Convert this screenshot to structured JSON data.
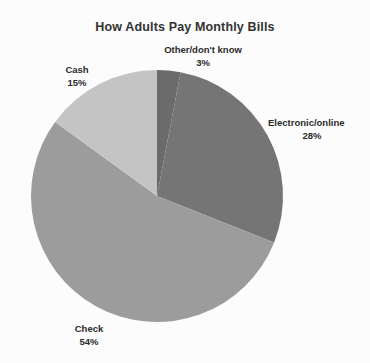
{
  "chart_data": {
    "type": "pie",
    "title": "How Adults Pay Monthly Bills",
    "categories": [
      "Other/don't know",
      "Electronic/online",
      "Check",
      "Cash"
    ],
    "values": [
      3,
      28,
      54,
      15
    ],
    "unit": "%",
    "labels": [
      {
        "name": "Other/don't know",
        "value": "3%",
        "color": "#6b6b6b"
      },
      {
        "name": "Electronic/online",
        "value": "28%",
        "color": "#757575"
      },
      {
        "name": "Check",
        "value": "54%",
        "color": "#9c9c9c"
      },
      {
        "name": "Cash",
        "value": "15%",
        "color": "#c4c4c4"
      }
    ],
    "legend": "none",
    "grid": false,
    "start_angle_deg": 0,
    "direction": "clockwise",
    "background": "#fcfcfc",
    "title_color": "#333333",
    "label_color": "#2b2b2b"
  },
  "pie": {
    "center_x": 157,
    "center_y": 196,
    "radius": 126
  }
}
